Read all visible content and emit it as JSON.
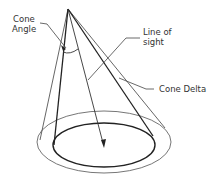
{
  "diagram": {
    "type": "cone-of-vision",
    "labels": {
      "cone_angle_line1": "Cone",
      "cone_angle_line2": "Angle",
      "line_of_sight_line1": "Line of",
      "line_of_sight_line2": "sight",
      "cone_delta": "Cone Delta"
    },
    "colors": {
      "line": "#222222",
      "thin_line": "#555555",
      "background": "#ffffff"
    }
  }
}
